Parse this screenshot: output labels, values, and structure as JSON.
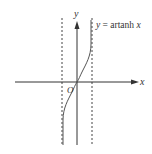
{
  "figure": {
    "title": "y = artanh x",
    "curve_label_prefix": "y = artanh ",
    "curve_label_var": "x",
    "x_axis_label": "x",
    "y_axis_label": "y",
    "origin_label": "O",
    "asymptotes": [
      "x = -1",
      "x = 1"
    ]
  },
  "colors": {
    "axis": "#333333",
    "curve": "#555555",
    "asymptote": "#444444",
    "background": "#ffffff"
  }
}
